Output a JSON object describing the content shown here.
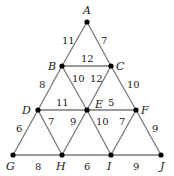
{
  "diagram": {
    "type": "weighted-graph",
    "nodes": [
      {
        "id": "A",
        "x": 87,
        "y": 22,
        "lx": 83,
        "ly": 14
      },
      {
        "id": "B",
        "x": 62,
        "y": 66,
        "lx": 48,
        "ly": 70
      },
      {
        "id": "C",
        "x": 111,
        "y": 66,
        "lx": 116,
        "ly": 70
      },
      {
        "id": "D",
        "x": 38,
        "y": 110,
        "lx": 22,
        "ly": 114
      },
      {
        "id": "E",
        "x": 87,
        "y": 110,
        "lx": 95,
        "ly": 108
      },
      {
        "id": "F",
        "x": 136,
        "y": 110,
        "lx": 141,
        "ly": 114
      },
      {
        "id": "G",
        "x": 13,
        "y": 155,
        "lx": 6,
        "ly": 170
      },
      {
        "id": "H",
        "x": 62,
        "y": 155,
        "lx": 56,
        "ly": 170
      },
      {
        "id": "I",
        "x": 111,
        "y": 155,
        "lx": 107,
        "ly": 170
      },
      {
        "id": "J",
        "x": 161,
        "y": 155,
        "lx": 160,
        "ly": 170
      }
    ],
    "edges": [
      {
        "from": "A",
        "to": "B",
        "weight": "11",
        "lx": 62,
        "ly": 44
      },
      {
        "from": "A",
        "to": "C",
        "weight": "7",
        "lx": 101,
        "ly": 44
      },
      {
        "from": "B",
        "to": "C",
        "weight": "12",
        "lx": 81,
        "ly": 62
      },
      {
        "from": "B",
        "to": "E",
        "weight": "10",
        "lx": 72,
        "ly": 82
      },
      {
        "from": "C",
        "to": "E",
        "weight": "12",
        "lx": 90,
        "ly": 82
      },
      {
        "from": "B",
        "to": "D",
        "weight": "8",
        "lx": 39,
        "ly": 88
      },
      {
        "from": "C",
        "to": "F",
        "weight": "10",
        "lx": 127,
        "ly": 88
      },
      {
        "from": "D",
        "to": "E",
        "weight": "11",
        "lx": 56,
        "ly": 106
      },
      {
        "from": "E",
        "to": "F",
        "weight": "5",
        "lx": 108,
        "ly": 106
      },
      {
        "from": "D",
        "to": "H",
        "weight": "7",
        "lx": 48,
        "ly": 125
      },
      {
        "from": "E",
        "to": "H",
        "weight": "9",
        "lx": 70,
        "ly": 125
      },
      {
        "from": "E",
        "to": "I",
        "weight": "10",
        "lx": 96,
        "ly": 125
      },
      {
        "from": "F",
        "to": "I",
        "weight": "7",
        "lx": 119,
        "ly": 125
      },
      {
        "from": "D",
        "to": "G",
        "weight": "6",
        "lx": 16,
        "ly": 132
      },
      {
        "from": "F",
        "to": "J",
        "weight": "9",
        "lx": 152,
        "ly": 132
      },
      {
        "from": "G",
        "to": "H",
        "weight": "8",
        "lx": 35,
        "ly": 170
      },
      {
        "from": "H",
        "to": "I",
        "weight": "6",
        "lx": 84,
        "ly": 170
      },
      {
        "from": "I",
        "to": "J",
        "weight": "9",
        "lx": 133,
        "ly": 170
      }
    ]
  }
}
